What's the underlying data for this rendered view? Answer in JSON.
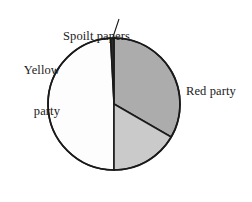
{
  "chart_data": {
    "type": "pie",
    "title": "",
    "subtitle": "",
    "xlabel": "",
    "ylabel": "",
    "legend_position": "none",
    "grid": false,
    "labels_position": "outside-callout",
    "center": {
      "cx": 114,
      "cy": 104,
      "r": 66
    },
    "start_angle_deg": 357,
    "categories": [
      "Spoilt papers",
      "Red party",
      "Blue party",
      "Yellow party"
    ],
    "values": [
      3,
      120,
      60,
      177
    ],
    "value_unit": "degrees",
    "percentages": [
      0.8,
      33.3,
      16.7,
      49.2
    ],
    "slices": [
      {
        "name": "Spoilt papers",
        "label": "Spoilt papers",
        "start_deg": 357,
        "end_deg": 360,
        "sweep_deg": 3,
        "fill": "#2b2b2b",
        "stroke": "#1a1a1a",
        "callout": true,
        "label_lines": [
          "Spoilt papers"
        ]
      },
      {
        "name": "Red party",
        "label": "Red party",
        "start_deg": 0,
        "end_deg": 120,
        "sweep_deg": 120,
        "fill": "#acacac",
        "stroke": "#1a1a1a",
        "callout": false,
        "label_lines": [
          "Red party"
        ]
      },
      {
        "name": "Blue party",
        "label": "Blue party",
        "start_deg": 120,
        "end_deg": 180,
        "sweep_deg": 60,
        "fill": "#cacaca",
        "stroke": "#1a1a1a",
        "callout": false,
        "label_lines": [
          "Blue party"
        ]
      },
      {
        "name": "Yellow party",
        "label": "Yellow party",
        "start_deg": 180,
        "end_deg": 357,
        "sweep_deg": 177,
        "fill": "#fdfdfd",
        "stroke": "#1a1a1a",
        "callout": false,
        "label_lines": [
          "Yellow",
          "party"
        ]
      }
    ],
    "callout_lines": [
      {
        "name": "spoilt-papers-leader",
        "x1": 119,
        "y1": 19,
        "x2": 112.5,
        "y2": 38.5
      }
    ]
  },
  "labels": {
    "spoilt": {
      "line1": "Spoilt papers"
    },
    "yellow": {
      "line1": "Yellow",
      "line2": "party"
    },
    "red": {
      "line1": "Red party"
    },
    "blue": {
      "line1": "Blue party"
    }
  },
  "colors": {
    "background": "#ffffff",
    "outline": "#1a1a1a",
    "text": "#1a1a1a",
    "spoilt_fill": "#2b2b2b",
    "red_fill": "#acacac",
    "blue_fill": "#cacaca",
    "yellow_fill": "#fdfdfd"
  }
}
